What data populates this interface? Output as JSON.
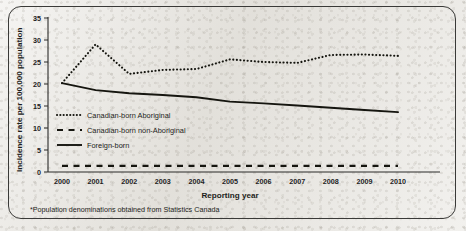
{
  "figure": {
    "footnote": "*Population denominations obtained from Statistics Canada"
  },
  "chart_data": {
    "type": "line",
    "title": "",
    "xlabel": "Reporting year",
    "ylabel": "Incidence rate per 100,000 population",
    "x": [
      2000,
      2001,
      2002,
      2003,
      2004,
      2005,
      2006,
      2007,
      2008,
      2009,
      2010
    ],
    "xticklabels": [
      "2000",
      "2001",
      "2002",
      "2003",
      "2004",
      "2005",
      "2006",
      "2007",
      "2008",
      "2009",
      "2010"
    ],
    "yticklabels": [
      "0",
      "5",
      "10",
      "15",
      "20",
      "25",
      "30",
      "35"
    ],
    "ytickvalues": [
      0,
      5,
      10,
      15,
      20,
      25,
      30,
      35
    ],
    "ylim": [
      0,
      35
    ],
    "xlim": [
      2000,
      2010
    ],
    "grid": false,
    "legend_position": "inside-left",
    "series": [
      {
        "name": "Canadian-born Aboriginal",
        "style": "dotted",
        "color": "#15150f",
        "values": [
          20.2,
          29.0,
          22.3,
          23.2,
          23.4,
          25.6,
          25.0,
          24.8,
          26.6,
          26.7,
          26.4
        ]
      },
      {
        "name": "Canadian-born non-Aboriginal",
        "style": "dashed",
        "color": "#15150f",
        "values": [
          1.4,
          1.4,
          1.4,
          1.4,
          1.4,
          1.4,
          1.4,
          1.4,
          1.4,
          1.4,
          1.4
        ]
      },
      {
        "name": "Foreign-born",
        "style": "solid",
        "color": "#15150f",
        "values": [
          20.2,
          18.6,
          17.9,
          17.5,
          17.0,
          16.0,
          15.6,
          15.1,
          14.6,
          14.1,
          13.6
        ]
      }
    ]
  }
}
